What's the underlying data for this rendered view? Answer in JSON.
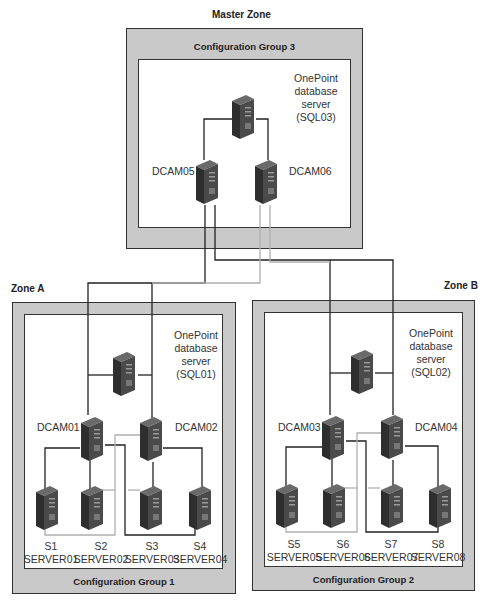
{
  "master_zone": {
    "title": "Master Zone",
    "group_label": "Configuration Group 3",
    "db_server": {
      "line1": "OnePoint",
      "line2": "database",
      "line3": "server",
      "line4": "(SQL03)"
    },
    "dcams": [
      {
        "label": "DCAM05"
      },
      {
        "label": "DCAM06"
      }
    ]
  },
  "zone_a": {
    "title": "Zone A",
    "group_label": "Configuration Group 1",
    "db_server": {
      "line1": "OnePoint",
      "line2": "database",
      "line3": "server",
      "line4": "(SQL01)"
    },
    "dcams": [
      {
        "label": "DCAM01"
      },
      {
        "label": "DCAM02"
      }
    ],
    "servers": [
      {
        "short": "S1",
        "name": "SERVER01"
      },
      {
        "short": "S2",
        "name": "SERVER02"
      },
      {
        "short": "S3",
        "name": "SERVER03"
      },
      {
        "short": "S4",
        "name": "SERVER04"
      }
    ]
  },
  "zone_b": {
    "title": "Zone B",
    "group_label": "Configuration Group 2",
    "db_server": {
      "line1": "OnePoint",
      "line2": "database",
      "line3": "server",
      "line4": "(SQL02)"
    },
    "dcams": [
      {
        "label": "DCAM03"
      },
      {
        "label": "DCAM04"
      }
    ],
    "servers": [
      {
        "short": "S5",
        "name": "SERVER05"
      },
      {
        "short": "S6",
        "name": "SERVER06"
      },
      {
        "short": "S7",
        "name": "SERVER07"
      },
      {
        "short": "S8",
        "name": "SERVER08"
      }
    ]
  },
  "colors": {
    "panel_gray": "#c9c9c9",
    "border": "#333333",
    "wire_dark": "#222222",
    "wire_light": "#b5b5b5",
    "server_front": "#4a4a4a",
    "server_side": "#2e2e2e",
    "server_top": "#6a6a6a"
  }
}
